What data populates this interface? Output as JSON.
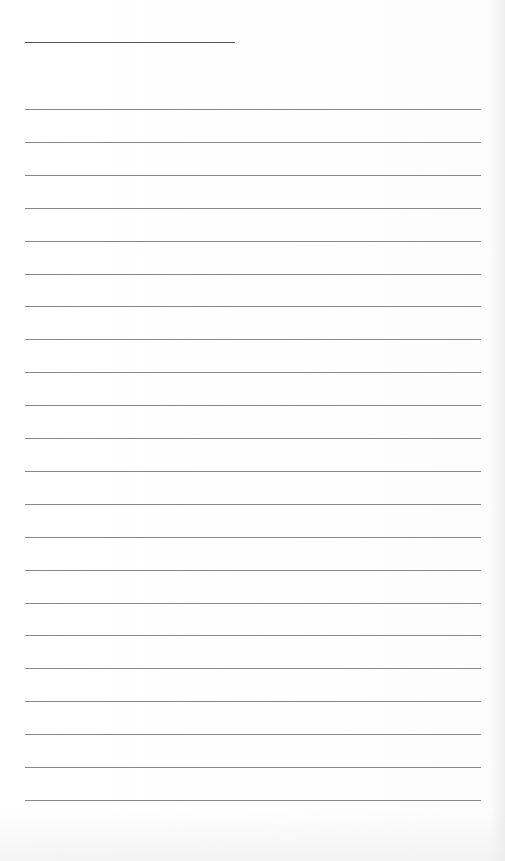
{
  "page": {
    "type": "lined-paper",
    "header_line": {
      "x": 25,
      "y": 42,
      "width": 210
    },
    "rules": {
      "count": 22,
      "start_y": 109,
      "spacing": 32.9,
      "x": 25,
      "width": 456
    },
    "colors": {
      "paper": "#fdfdfd",
      "rule": "#6a6a6a"
    }
  }
}
